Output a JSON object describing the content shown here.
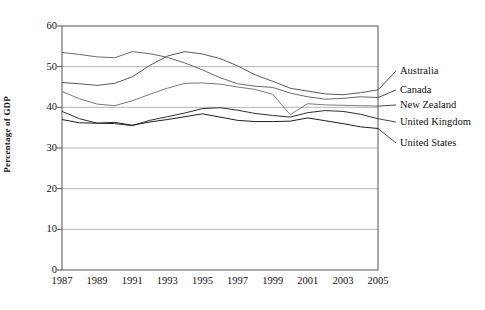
{
  "chart_data": {
    "type": "line",
    "title": "",
    "xlabel": "",
    "ylabel": "Percentage of GDP",
    "ylim": [
      0,
      60
    ],
    "yticks": [
      0,
      10,
      20,
      30,
      40,
      50,
      60
    ],
    "xlim": [
      1987,
      2005
    ],
    "xticks": [
      1987,
      1989,
      1991,
      1993,
      1995,
      1997,
      1999,
      2001,
      2003,
      2005
    ],
    "x": [
      1987,
      1988,
      1989,
      1990,
      1991,
      1992,
      1993,
      1994,
      1995,
      1996,
      1997,
      1998,
      1999,
      2000,
      2001,
      2002,
      2003,
      2004,
      2005
    ],
    "grid": "horizontal",
    "legend_position": "right-of-plot-inline",
    "series": [
      {
        "name": "Australia",
        "color": "#5a5a5a",
        "values": [
          46.1,
          45.8,
          45.4,
          45.9,
          47.5,
          50.3,
          52.6,
          53.7,
          53.1,
          52.0,
          50.2,
          48.0,
          46.4,
          44.7,
          44.0,
          43.3,
          43.1,
          43.6,
          44.3
        ]
      },
      {
        "name": "Canada",
        "color": "#6a6a6a",
        "values": [
          53.5,
          53.0,
          52.4,
          52.2,
          53.7,
          53.2,
          52.3,
          50.9,
          49.2,
          47.3,
          45.8,
          45.2,
          44.9,
          43.5,
          42.6,
          42.0,
          42.2,
          42.6,
          42.4
        ]
      },
      {
        "name": "New Zealand",
        "color": "#7a7a7a",
        "values": [
          43.9,
          42.1,
          40.8,
          40.4,
          41.6,
          43.2,
          44.7,
          45.9,
          46.0,
          45.7,
          45.0,
          44.4,
          43.2,
          38.2,
          40.9,
          40.6,
          40.5,
          40.4,
          40.3
        ]
      },
      {
        "name": "United Kingdom",
        "color": "#2f2f2f",
        "values": [
          39.0,
          37.2,
          36.1,
          36.0,
          35.5,
          36.8,
          37.7,
          38.6,
          39.7,
          39.9,
          39.3,
          38.5,
          38.0,
          37.6,
          38.7,
          39.2,
          39.0,
          38.3,
          37.2
        ]
      },
      {
        "name": "United States",
        "color": "#1f1f1f",
        "values": [
          37.0,
          36.2,
          36.1,
          36.3,
          35.6,
          36.4,
          37.0,
          37.7,
          38.4,
          37.6,
          36.8,
          36.5,
          36.5,
          36.6,
          37.4,
          36.7,
          36.0,
          35.2,
          34.8
        ]
      }
    ]
  },
  "axis": {
    "y_title": "Percentage of GDP"
  },
  "legend": {
    "items": [
      {
        "label": "Australia"
      },
      {
        "label": "Canada"
      },
      {
        "label": "New Zealand"
      },
      {
        "label": "United Kingdom"
      },
      {
        "label": "United States"
      }
    ]
  },
  "style": {
    "grid_color": "#b5b5b5",
    "frame_color": "#555555",
    "text_color": "#111111"
  }
}
